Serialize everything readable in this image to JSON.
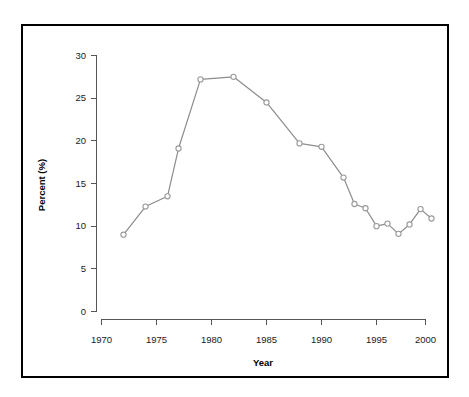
{
  "chart_data": {
    "type": "line",
    "title": "",
    "xlabel": "Year",
    "ylabel": "Percent (%)",
    "xlim": [
      1968.5,
      2001.5
    ],
    "ylim": [
      -1,
      31
    ],
    "xticks": [
      1970,
      1975,
      1980,
      1985,
      1990,
      1995,
      2000
    ],
    "xtick_labels": [
      "1970",
      "1975",
      "1980",
      "1985",
      "1990",
      "1995",
      "2000"
    ],
    "yticks": [
      0,
      5,
      10,
      15,
      20,
      25,
      30
    ],
    "ytick_labels": [
      "0",
      "5",
      "10",
      "15",
      "20",
      "25",
      "30"
    ],
    "grid": false,
    "legend": false,
    "legend_position": "none",
    "marker": "open-circle",
    "line_color": "#8c8c8c",
    "marker_face_color": "#ffffff",
    "marker_edge_color": "#9a9a9a",
    "x": [
      1972,
      1974,
      1976,
      1977,
      1979,
      1982,
      1985,
      1988,
      1990,
      1992,
      1993,
      1994,
      1995,
      1996,
      1997,
      1998,
      1999,
      2000
    ],
    "values": [
      9.0,
      12.3,
      13.5,
      19.1,
      27.2,
      27.5,
      24.5,
      19.7,
      19.3,
      15.7,
      12.6,
      12.1,
      10.0,
      10.3,
      9.1,
      10.2,
      12.0,
      10.9
    ],
    "series": [
      {
        "name": "Percent",
        "x": [
          1972,
          1974,
          1976,
          1977,
          1979,
          1982,
          1985,
          1988,
          1990,
          1992,
          1993,
          1994,
          1995,
          1996,
          1997,
          1998,
          1999,
          2000
        ],
        "values": [
          9.0,
          12.3,
          13.5,
          19.1,
          27.2,
          27.5,
          24.5,
          19.7,
          19.3,
          15.7,
          12.6,
          12.1,
          10.0,
          10.3,
          9.1,
          10.2,
          12.0,
          10.9
        ]
      }
    ],
    "annotations": []
  },
  "figure": {
    "border_color": "#000000",
    "background_color": "#ffffff"
  }
}
